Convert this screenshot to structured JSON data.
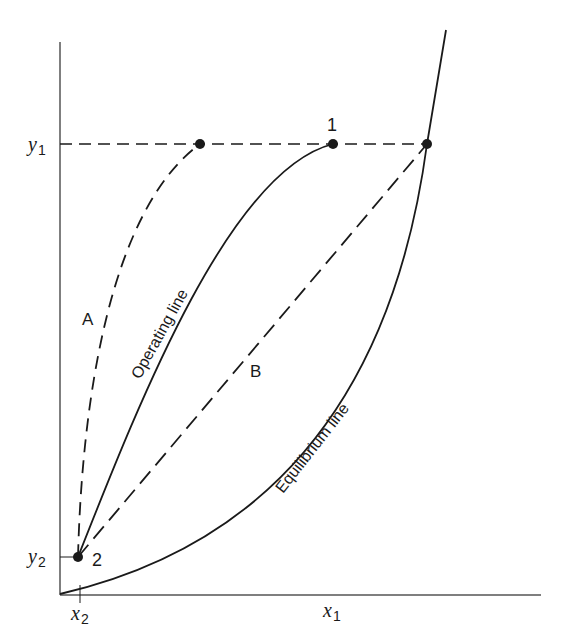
{
  "figure": {
    "type": "absorption operating-line / equilibrium-line diagram",
    "axes": {
      "y_labels": [
        {
          "var": "y",
          "sub": "1"
        },
        {
          "var": "y",
          "sub": "2"
        }
      ],
      "x_labels": [
        {
          "var": "x",
          "sub": "2"
        },
        {
          "var": "x",
          "sub": "1"
        }
      ]
    },
    "curve_labels": {
      "operating": "Operating line",
      "equilibrium": "Equilibrium line",
      "a": "A",
      "b": "B"
    },
    "point_labels": {
      "p1": "1",
      "p2": "2"
    },
    "colors": {
      "line": "#1a1a1a",
      "axis": "#555555",
      "background": "#ffffff"
    }
  }
}
